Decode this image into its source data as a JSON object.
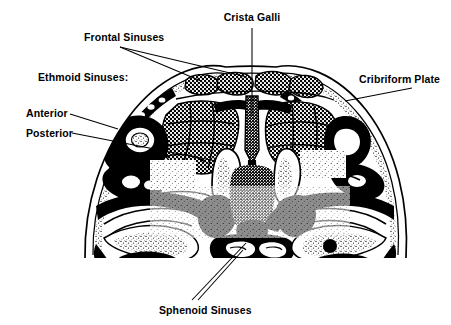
{
  "figure": {
    "kind": "anatomical-illustration",
    "style": "black-and-white line engraving with halftone stipple",
    "background_color": "#ffffff",
    "ink_color": "#000000",
    "width": 451,
    "height": 325
  },
  "labels": [
    {
      "id": "frontal-sinuses",
      "text": "Frontal Sinuses",
      "x": 84,
      "y": 41,
      "anchor": "start",
      "leaders": [
        {
          "points": "120,47 201,81"
        },
        {
          "points": "120,47 247,77"
        }
      ]
    },
    {
      "id": "ethmoid-sinuses",
      "text": "Ethmoid Sinuses:",
      "x": 38,
      "y": 81,
      "anchor": "start",
      "leaders": []
    },
    {
      "id": "anterior",
      "text": "Anterior",
      "x": 26,
      "y": 117,
      "anchor": "start",
      "leaders": [
        {
          "points": "70,114 118,129"
        }
      ]
    },
    {
      "id": "posterior",
      "text": "Posterior",
      "x": 26,
      "y": 137,
      "anchor": "start",
      "leaders": [
        {
          "points": "72,133 216,161"
        }
      ]
    },
    {
      "id": "crista-galli",
      "text": "Crista Galli",
      "x": 252,
      "y": 21,
      "anchor": "middle",
      "leaders": [
        {
          "points": "252,28 252,116"
        }
      ]
    },
    {
      "id": "cribriform-plate",
      "text": "Cribriform Plate",
      "x": 359,
      "y": 83,
      "anchor": "start",
      "leaders": [
        {
          "points": "412,88 345,101"
        }
      ]
    },
    {
      "id": "sphenoid-sinuses",
      "text": "Sphenoid Sinuses",
      "x": 159,
      "y": 314,
      "anchor": "start",
      "leaders": [
        {
          "points": "192,300 246,243"
        },
        {
          "points": "198,300 243,250"
        }
      ]
    }
  ]
}
